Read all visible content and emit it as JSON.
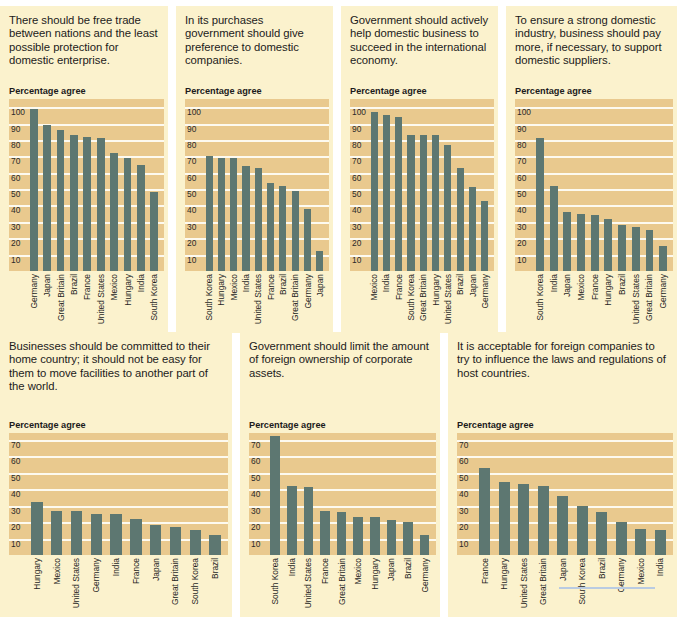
{
  "axis_label": "Percentage agree",
  "colors": {
    "bar": "#5d7771",
    "plot_bg": "#e9c98e",
    "panel_bg": "#fbf2cd",
    "gridline": "#fdfaf0",
    "rule": "#b9cbe2"
  },
  "chart_data": [
    {
      "type": "bar",
      "title": "There should be free trade between nations and the least possible protection for domestic enterprise.",
      "ylabel": "Percentage agree",
      "xlabel": "",
      "ylim": [
        0,
        105
      ],
      "yticks": [
        100,
        90,
        80,
        70,
        60,
        50,
        40,
        30,
        20,
        10
      ],
      "grid": true,
      "categories": [
        "Germany",
        "Japan",
        "Great Britain",
        "Brazil",
        "France",
        "United States",
        "Mexico",
        "Hungary",
        "India",
        "South Korea"
      ],
      "values": [
        99,
        89,
        86,
        83,
        82,
        81,
        72,
        69,
        65,
        48
      ]
    },
    {
      "type": "bar",
      "title": "In its purchases government should give preference to domestic companies.",
      "ylabel": "Percentage agree",
      "xlabel": "",
      "ylim": [
        0,
        105
      ],
      "yticks": [
        100,
        90,
        80,
        70,
        60,
        50,
        40,
        30,
        20,
        10
      ],
      "grid": true,
      "categories": [
        "South Korea",
        "Hungary",
        "Mexico",
        "India",
        "United States",
        "France",
        "Brazil",
        "Great Britain",
        "Germany",
        "Japan"
      ],
      "values": [
        70,
        69,
        69,
        64,
        63,
        54,
        52,
        49,
        38,
        12
      ]
    },
    {
      "type": "bar",
      "title": "Government should actively help domestic business to succeed in the international economy.",
      "ylabel": "Percentage agree",
      "xlabel": "",
      "ylim": [
        0,
        105
      ],
      "yticks": [
        100,
        90,
        80,
        70,
        60,
        50,
        40,
        30,
        20,
        10
      ],
      "grid": true,
      "categories": [
        "Mexico",
        "India",
        "France",
        "South Korea",
        "Great Britain",
        "Hungary",
        "United States",
        "Brazil",
        "Japan",
        "Germany"
      ],
      "values": [
        97,
        95,
        94,
        83,
        83,
        83,
        77,
        63,
        51,
        43
      ]
    },
    {
      "type": "bar",
      "title": "To ensure a strong domestic industry, business should pay more, if necessary, to support domestic suppliers.",
      "ylabel": "Percentage agree",
      "xlabel": "",
      "ylim": [
        0,
        105
      ],
      "yticks": [
        100,
        90,
        80,
        70,
        60,
        50,
        40,
        30,
        20,
        10
      ],
      "grid": true,
      "categories": [
        "South Korea",
        "India",
        "Japan",
        "Mexico",
        "France",
        "Hungary",
        "Brazil",
        "United States",
        "Great Britain",
        "Germany"
      ],
      "values": [
        81,
        52,
        36,
        35,
        34,
        32,
        28,
        27,
        25,
        15
      ]
    },
    {
      "type": "bar",
      "title": "Businesses should be committed to their home country; it should not be easy for them to move facilities to another part of the world.",
      "ylabel": "Percentage agree",
      "xlabel": "",
      "ylim": [
        0,
        74
      ],
      "yticks": [
        70,
        60,
        50,
        40,
        30,
        20,
        10
      ],
      "grid": true,
      "categories": [
        "Hungary",
        "Mexico",
        "United States",
        "Germany",
        "India",
        "France",
        "Japan",
        "Great Britain",
        "South Korea",
        "Brazil"
      ],
      "values": [
        32,
        27,
        27,
        25,
        25,
        22,
        18,
        17,
        15,
        12
      ]
    },
    {
      "type": "bar",
      "title": "Government should limit the amount of foreign ownership of corporate assets.",
      "ylabel": "Percentage agree",
      "xlabel": "",
      "ylim": [
        0,
        74
      ],
      "yticks": [
        70,
        60,
        50,
        40,
        30,
        20,
        10
      ],
      "grid": true,
      "categories": [
        "South Korea",
        "India",
        "United States",
        "France",
        "Great Britain",
        "Mexico",
        "Hungary",
        "Japan",
        "Brazil",
        "Germany"
      ],
      "values": [
        72,
        42,
        41,
        27,
        26,
        23,
        23,
        21,
        20,
        12
      ]
    },
    {
      "type": "bar",
      "title": "It is acceptable for foreign companies to try to influence the laws and regulations of host countries.",
      "ylabel": "Percentage agree",
      "xlabel": "",
      "ylim": [
        0,
        74
      ],
      "yticks": [
        70,
        60,
        50,
        40,
        30,
        20,
        10
      ],
      "grid": true,
      "categories": [
        "France",
        "Hungary",
        "United States",
        "Great Britain",
        "Japan",
        "South Korea",
        "Brazil",
        "Germany",
        "Mexico",
        "India"
      ],
      "values": [
        53,
        44,
        43,
        42,
        36,
        30,
        26,
        20,
        16,
        15
      ]
    }
  ]
}
